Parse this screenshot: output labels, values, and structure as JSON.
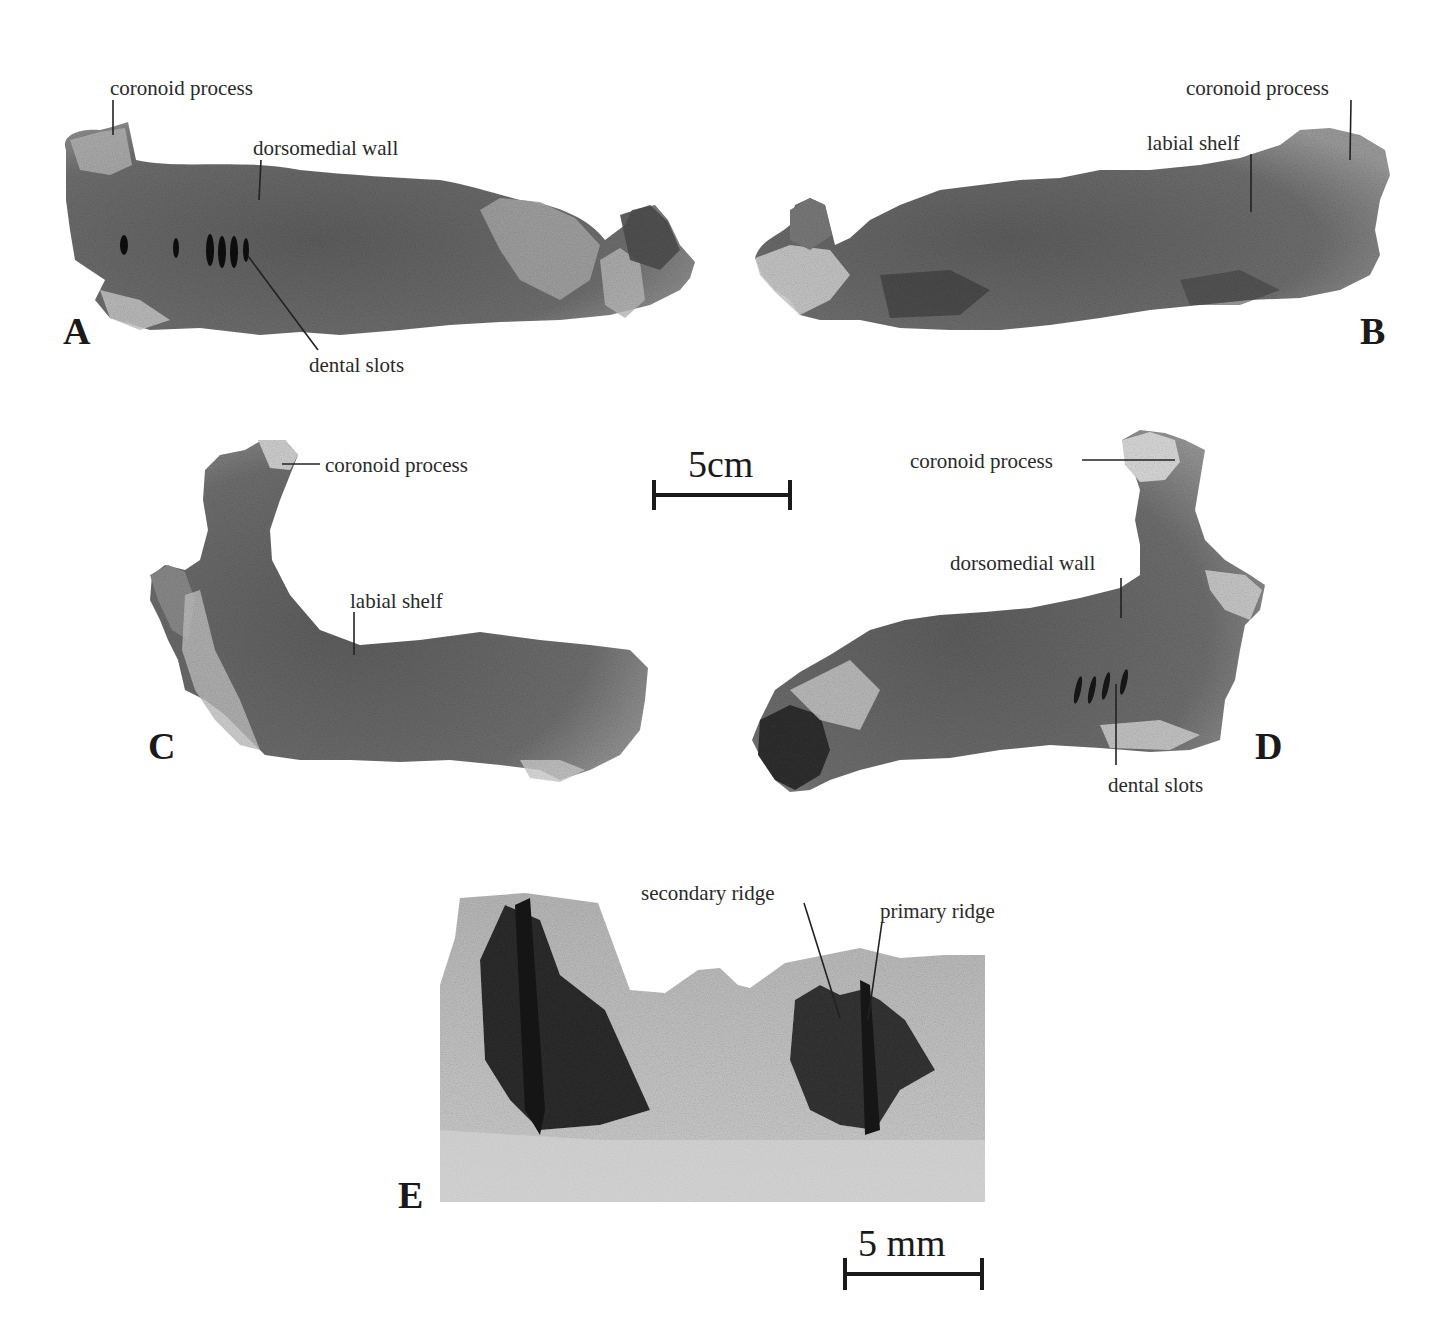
{
  "figure": {
    "panels": [
      {
        "id": "A",
        "letter": "A",
        "labels": {
          "coronoid": "coronoid process",
          "dorsomedial": "dorsomedial wall",
          "dental": "dental slots"
        }
      },
      {
        "id": "B",
        "letter": "B",
        "labels": {
          "coronoid": "coronoid process",
          "labial": "labial shelf"
        }
      },
      {
        "id": "C",
        "letter": "C",
        "labels": {
          "coronoid": "coronoid process",
          "labial": "labial shelf"
        }
      },
      {
        "id": "D",
        "letter": "D",
        "labels": {
          "coronoid": "coronoid process",
          "dorsomedial": "dorsomedial wall",
          "dental": "dental slots"
        }
      },
      {
        "id": "E",
        "letter": "E",
        "labels": {
          "secondary": "secondary ridge",
          "primary": "primary ridge"
        }
      }
    ],
    "scale_bars": {
      "large": "5cm",
      "small": "5 mm"
    },
    "colors": {
      "bone_dark": "#5a5a5a",
      "bone_mid": "#7d7d7d",
      "bone_light": "#c8c8c8",
      "ink": "#1a1a1a"
    }
  }
}
